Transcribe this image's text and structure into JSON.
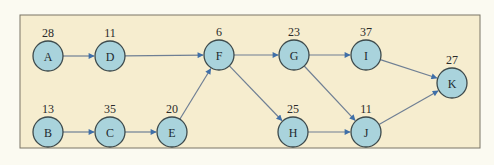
{
  "diagram": {
    "type": "network-diagram",
    "frame": {
      "x": 20,
      "y": 15,
      "width": 460,
      "height": 133
    },
    "colors": {
      "page_background": "#fbfaf1",
      "frame_fill": "#f6edcf",
      "node_fill": "#a9d3dc",
      "node_stroke": "#3d4a4c",
      "edge": "#6f7f94",
      "arrowhead": "#3f6fa8"
    },
    "nodes": [
      {
        "id": "A",
        "label": "A",
        "duration": "28",
        "x": 48,
        "y": 56
      },
      {
        "id": "D",
        "label": "D",
        "duration": "11",
        "x": 110,
        "y": 56
      },
      {
        "id": "F",
        "label": "F",
        "duration": "6",
        "x": 219,
        "y": 55
      },
      {
        "id": "G",
        "label": "G",
        "duration": "23",
        "x": 294,
        "y": 55
      },
      {
        "id": "I",
        "label": "I",
        "duration": "37",
        "x": 366,
        "y": 55
      },
      {
        "id": "K",
        "label": "K",
        "duration": "27",
        "x": 452,
        "y": 83
      },
      {
        "id": "B",
        "label": "B",
        "duration": "13",
        "x": 48,
        "y": 132
      },
      {
        "id": "C",
        "label": "C",
        "duration": "35",
        "x": 110,
        "y": 132
      },
      {
        "id": "E",
        "label": "E",
        "duration": "20",
        "x": 172,
        "y": 132
      },
      {
        "id": "H",
        "label": "H",
        "duration": "25",
        "x": 293,
        "y": 132
      },
      {
        "id": "J",
        "label": "J",
        "duration": "11",
        "x": 366,
        "y": 132
      }
    ],
    "edges": [
      {
        "from": "A",
        "to": "D"
      },
      {
        "from": "D",
        "to": "F"
      },
      {
        "from": "B",
        "to": "C"
      },
      {
        "from": "C",
        "to": "E"
      },
      {
        "from": "E",
        "to": "F"
      },
      {
        "from": "F",
        "to": "G"
      },
      {
        "from": "F",
        "to": "H"
      },
      {
        "from": "G",
        "to": "I"
      },
      {
        "from": "G",
        "to": "J"
      },
      {
        "from": "H",
        "to": "J"
      },
      {
        "from": "I",
        "to": "K"
      },
      {
        "from": "J",
        "to": "K"
      }
    ],
    "node_radius": 15
  }
}
